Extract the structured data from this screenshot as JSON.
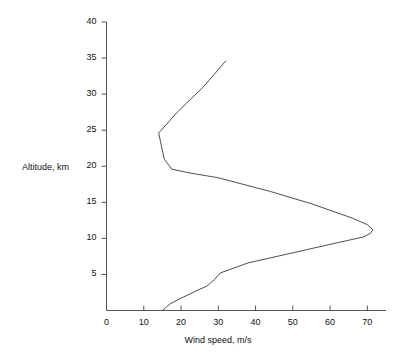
{
  "chart_data": {
    "type": "line",
    "title": "",
    "xlabel": "Wind speed, m/s",
    "ylabel": "Altitude, km",
    "xlim": [
      0,
      75
    ],
    "ylim": [
      0,
      40
    ],
    "xticks": [
      0,
      10,
      20,
      30,
      40,
      50,
      60,
      70
    ],
    "yticks": [
      0,
      5,
      10,
      15,
      20,
      25,
      30,
      35,
      40
    ],
    "xtick_labels": [
      "0",
      "10",
      "20",
      "30",
      "40",
      "50",
      "60",
      "70"
    ],
    "ytick_labels": [
      "",
      "5",
      "10",
      "15",
      "20",
      "25",
      "30",
      "35",
      "40"
    ],
    "grid": false,
    "legend": "none",
    "series": [
      {
        "name": "Wind speed profile",
        "orientation": "vertical",
        "x": [
          15.0,
          17.0,
          20.0,
          24.0,
          27.0,
          29.0,
          30.5,
          38.0,
          50.0,
          62.0,
          69.0,
          70.8,
          71.5,
          70.0,
          66.0,
          55.0,
          44.0,
          30.0,
          22.0,
          17.5,
          15.5,
          14.0,
          19.0,
          26.0,
          32.0
        ],
        "y": [
          0.0,
          0.9,
          1.7,
          2.7,
          3.4,
          4.3,
          5.2,
          6.6,
          8.0,
          9.4,
          10.2,
          10.7,
          11.2,
          11.9,
          12.8,
          14.8,
          16.5,
          18.4,
          19.1,
          19.6,
          21.0,
          24.6,
          27.5,
          31.0,
          34.6
        ]
      }
    ]
  },
  "axis": {
    "y_title": "Altitude, km",
    "x_title": "Wind speed, m/s"
  }
}
